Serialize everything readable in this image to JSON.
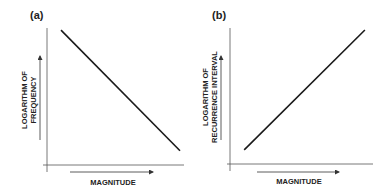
{
  "chart_data": [
    {
      "type": "line",
      "panel_label": "(a)",
      "title": "",
      "xlabel": "MAGNITUDE",
      "ylabel": [
        "LOGARITHM OF",
        "FREQUENCY"
      ],
      "x": [
        0.1,
        0.95
      ],
      "y": [
        0.95,
        0.1
      ],
      "trend": "decreasing",
      "xlim": [
        0,
        1
      ],
      "ylim": [
        0,
        1
      ],
      "grid": false,
      "ticks": "none (schematic)"
    },
    {
      "type": "line",
      "panel_label": "(b)",
      "title": "",
      "xlabel": "MAGNITUDE",
      "ylabel": [
        "LOGARITHM OF",
        "RECURRENCE INTERVAL"
      ],
      "x": [
        0.1,
        0.95
      ],
      "y": [
        0.1,
        0.95
      ],
      "trend": "increasing",
      "xlim": [
        0,
        1
      ],
      "ylim": [
        0,
        1
      ],
      "grid": false,
      "ticks": "none (schematic)"
    }
  ],
  "colors": {
    "line": "#1a1a1a",
    "axis": "#555555",
    "text": "#222222"
  }
}
